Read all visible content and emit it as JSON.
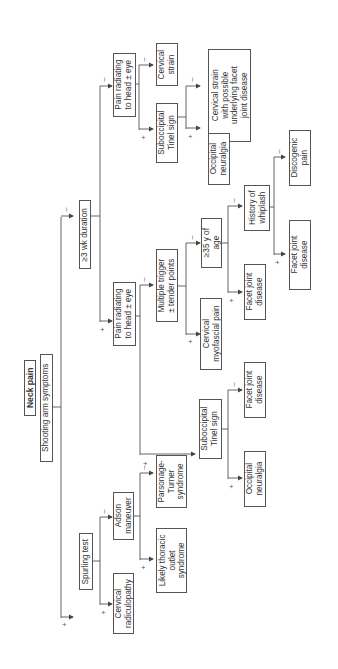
{
  "diagram": {
    "title": "Neck pain",
    "orientation": "rotated 90 degrees counterclockwise",
    "nodes": {
      "neck_pain": "Neck pain",
      "shooting_arm": "Shooting arm symptoms",
      "duration": "≥3 wk duration",
      "pain_radiating_top": "Pain radiating\nto head ± eye",
      "cervical_strain": "Cervical\nstrain",
      "subocc_top": "Suboccipital\nTinel sign",
      "cs_facet": "Cervical strain\nwith possible\nunderlying facet\njoint disease",
      "occ_neuralgia_top": "Occipital\nneuralgia",
      "pain_radiating_mid": "Pain radiating\nto head ± eye",
      "multiple_trigger": "Multiple trigger\n± tender points",
      "age35": "≥35 y of\nage",
      "whiplash": "History of\nwhiplash",
      "discogenic": "Discogenic\npain",
      "facet_whiplash": "Facet joint\ndisease",
      "facet_age": "Facet joint\ndisease",
      "myofascial": "Cervical\nmyofascial pain",
      "subocc_mid": "Suboccipital\nTinel sign",
      "facet_subocc": "Facet joint\ndisease",
      "occ_neuralgia_mid": "Occipital\nneuralgia",
      "spurling": "Spurling test",
      "adson": "Adson\nmaneuver",
      "parsonage": "Parsonage-\nTurner\nsyndrome",
      "thoracic_outlet": "Likely thoracic\noutlet\nsyndrome",
      "radiculopathy": "Cervical\nradiculopathy"
    },
    "branch_labels": {
      "plus": "+",
      "minus": "–"
    },
    "colors": {
      "line": "#555555",
      "text": "#333333",
      "background": "#ffffff"
    }
  }
}
